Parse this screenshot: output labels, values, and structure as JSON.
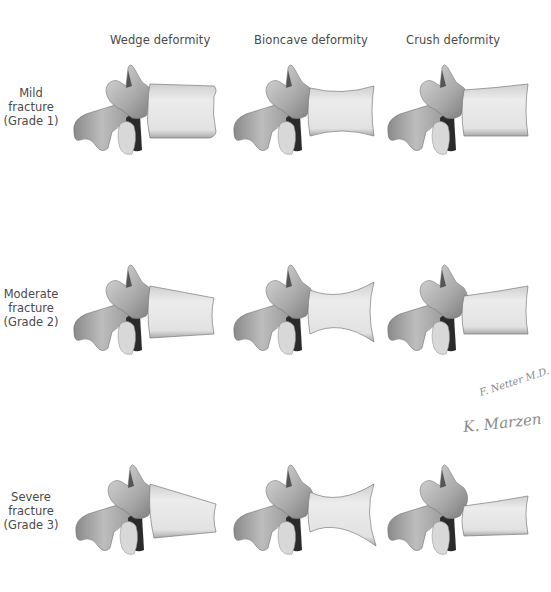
{
  "figure": {
    "columns": [
      {
        "label": "Wedge deformity",
        "type": "wedge"
      },
      {
        "label": "Bioncave deformity",
        "type": "biconcave"
      },
      {
        "label": "Crush deformity",
        "type": "crush"
      }
    ],
    "rows": [
      {
        "line1": "Mild",
        "line2": "fracture",
        "line3": "(Grade 1)",
        "grade": 1
      },
      {
        "line1": "Moderate",
        "line2": "fracture",
        "line3": "(Grade 2)",
        "grade": 2
      },
      {
        "line1": "Severe",
        "line2": "fracture",
        "line3": "(Grade 3)",
        "grade": 3
      }
    ],
    "signatures": {
      "first": "F. Netter M.D.",
      "second": "K. Marzen"
    },
    "colors": {
      "bone_light": "#e6e6e6",
      "bone_mid": "#b8b8b8",
      "bone_dark": "#6e6e6e",
      "canal_dark": "#2b2b2b",
      "text": "#4a4a4a",
      "signature": "#8a8a8a"
    }
  }
}
